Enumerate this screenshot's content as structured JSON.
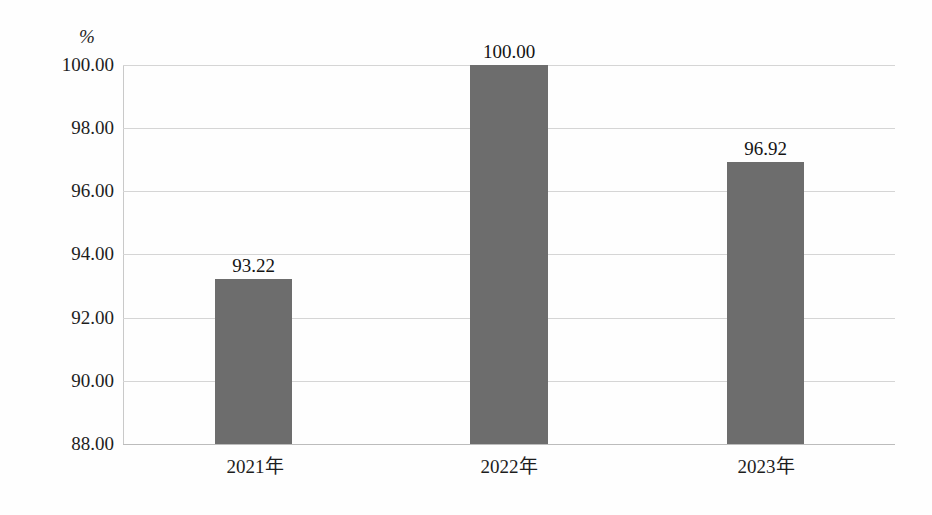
{
  "chart_data": {
    "type": "bar",
    "title": "",
    "subtitle": "",
    "categories": [
      "2021年",
      "2022年",
      "2023年"
    ],
    "values": [
      93.22,
      100.0,
      96.92
    ],
    "value_labels": [
      "93.22",
      "100.00",
      "96.92"
    ],
    "series": [
      {
        "name": "",
        "values": [
          93.22,
          100.0,
          96.92
        ]
      }
    ],
    "xlabel": "",
    "ylabel": "%",
    "y_unit_label": "%",
    "ylim": [
      88.0,
      100.0
    ],
    "ytick_values": [
      100.0,
      98.0,
      96.0,
      94.0,
      92.0,
      90.0,
      88.0
    ],
    "ytick_labels": [
      "100.00",
      "98.00",
      "96.00",
      "94.00",
      "92.00",
      "90.00",
      "88.00"
    ],
    "ytick_step": 2.0,
    "grid": true,
    "grid_axis": "y",
    "legend": false,
    "legend_position": "none",
    "bar_color": "#6d6d6d",
    "gridline_color": "#d5d5d5",
    "axis_color": "#bcbcbc",
    "background_color": "#ffffff",
    "data_labels_shown": true
  }
}
